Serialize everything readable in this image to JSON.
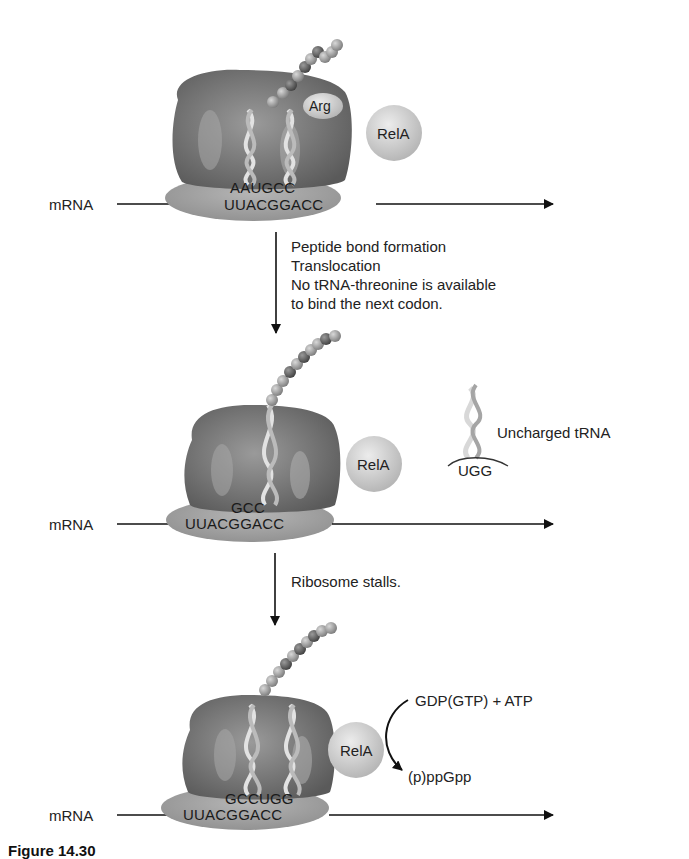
{
  "figure": {
    "caption_partial": "Figure 14.30",
    "panels": [
      {
        "mrna_label": "mRNA",
        "trna_anticodons": "AAUGCC",
        "mrna_sequence": "UUACGGACC",
        "amino_acid_label": "Arg",
        "protein_label": "RelA"
      },
      {
        "mrna_label": "mRNA",
        "trna_anticodons": "GCC",
        "mrna_sequence": "UUACGGACC",
        "protein_label": "RelA",
        "uncharged_trna_label": "Uncharged tRNA",
        "uncharged_trna_anticodon": "UGG"
      },
      {
        "mrna_label": "mRNA",
        "trna_anticodons": "GCCUGG",
        "mrna_sequence": "UUACGGACC",
        "protein_label": "RelA",
        "reaction_substrates": "GDP(GTP) + ATP",
        "reaction_product": "(p)ppGpp"
      }
    ],
    "steps": [
      {
        "lines": [
          "Peptide bond formation",
          "Translocation",
          "No tRNA-threonine is available",
          "to bind the next codon."
        ]
      },
      {
        "lines": [
          "Ribosome stalls."
        ]
      }
    ]
  },
  "colors": {
    "ribosome_dark": "#6e6e6e",
    "ribosome_light": "#a9a9a9",
    "rela_fill": "#cfcfcf",
    "arrow": "#111111"
  }
}
